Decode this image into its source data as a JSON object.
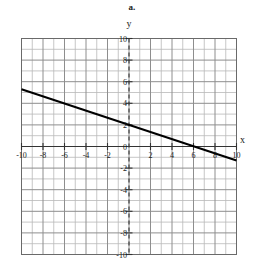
{
  "figure": {
    "part_label": "a.",
    "x_axis_name": "x",
    "y_axis_name": "y"
  },
  "chart_data": {
    "type": "line",
    "title": "a.",
    "xlabel": "x",
    "ylabel": "y",
    "xlim": [
      -10,
      10
    ],
    "ylim": [
      -10,
      10
    ],
    "grid": true,
    "grid_step": 1,
    "tick_step": 2,
    "legend": "none",
    "x_ticks": [
      -10,
      -8,
      -6,
      -4,
      -2,
      2,
      4,
      6,
      8,
      10
    ],
    "y_ticks": [
      10,
      8,
      6,
      4,
      2,
      0,
      -2,
      -4,
      -6,
      -8,
      -10
    ],
    "x_tick_labels": [
      "-10",
      "-8",
      "-6",
      "-4",
      "-2",
      "2",
      "4",
      "6",
      "8",
      "10"
    ],
    "y_tick_labels": [
      "10",
      "8",
      "6",
      "4",
      "2",
      "0",
      "-2",
      "-4",
      "-6",
      "-8",
      "-10"
    ],
    "origin_label": "0",
    "series": [
      {
        "name": "line",
        "type": "line",
        "slope": -0.33,
        "intercept": 2,
        "x_intercept": 6,
        "y_intercept": 2,
        "points": [
          {
            "x": -10,
            "y": 5.3
          },
          {
            "x": 10,
            "y": -1.3
          }
        ]
      }
    ],
    "colors": {
      "line": "#000000",
      "grid_minor": "#b9b9b9",
      "grid_major": "#8e8e8e",
      "axis": "#333333",
      "border": "#6a6a6a",
      "text": "#1a1a1a"
    }
  }
}
